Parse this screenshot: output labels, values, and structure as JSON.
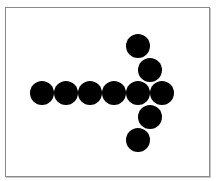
{
  "diagram": {
    "dot_color": "#000000",
    "frame_color": "#8a8a8a",
    "dot_diameter": 24,
    "dots": [
      {
        "x": 42,
        "y": 93
      },
      {
        "x": 66,
        "y": 93
      },
      {
        "x": 90,
        "y": 93
      },
      {
        "x": 114,
        "y": 93
      },
      {
        "x": 138,
        "y": 93
      },
      {
        "x": 162,
        "y": 93
      },
      {
        "x": 138,
        "y": 46
      },
      {
        "x": 150,
        "y": 70
      },
      {
        "x": 150,
        "y": 117
      },
      {
        "x": 138,
        "y": 140
      }
    ]
  }
}
